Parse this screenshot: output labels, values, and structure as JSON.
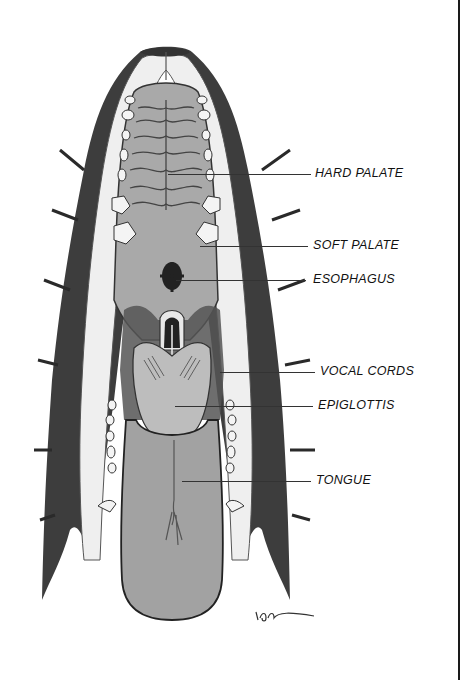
{
  "diagram": {
    "labels": [
      {
        "id": "hard-palate",
        "text": "HARD PALATE",
        "x": 315,
        "y": 166,
        "line_from": 168,
        "line_to": 311,
        "line_y": 174
      },
      {
        "id": "soft-palate",
        "text": "SOFT PALATE",
        "x": 313,
        "y": 234,
        "line_from": 168,
        "line_to": 308,
        "line_y": 246
      },
      {
        "id": "esophagus",
        "text": "ESOPHAGUS",
        "x": 313,
        "y": 271,
        "line_from": 176,
        "line_to": 306,
        "line_y": 280
      },
      {
        "id": "vocal-cords",
        "text": "VOCAL CORDS",
        "x": 320,
        "y": 361,
        "line_from": 220,
        "line_to": 315,
        "line_y": 372
      },
      {
        "id": "epiglottis",
        "text": "EPIGLOTTIS",
        "x": 318,
        "y": 400,
        "line_from": 175,
        "line_to": 313,
        "line_y": 406
      },
      {
        "id": "tongue",
        "text": "TONGUE",
        "x": 316,
        "y": 471,
        "line_from": 182,
        "line_to": 311,
        "line_y": 481
      }
    ],
    "signature": "ion~",
    "colors": {
      "background": "#ffffff",
      "tissue": "#a8a8a8",
      "fur": "#3a3a3a",
      "lip": "#ececec",
      "outline": "#2a2a2a"
    }
  }
}
